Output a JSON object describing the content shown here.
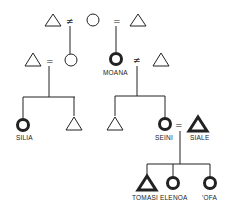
{
  "diagram": {
    "type": "kinship",
    "symbols": {
      "marriage": "=",
      "divorce": "≠"
    },
    "people": {
      "silia": {
        "label": "SILIA",
        "sex": "female",
        "ego_line": true
      },
      "moana": {
        "label": "MOANA",
        "sex": "female",
        "ego_line": true
      },
      "seini": {
        "label": "SEINI",
        "sex": "female",
        "ego_line": true
      },
      "siale": {
        "label": "SIALE",
        "sex": "male",
        "ego_line": true
      },
      "tomasi": {
        "label": "TOMASI",
        "sex": "male",
        "ego_line": true
      },
      "elenoa": {
        "label": "ELENOA",
        "sex": "female",
        "ego_line": true
      },
      "ofa": {
        "label": "'OFA",
        "sex": "female",
        "ego_line": true
      }
    },
    "colors": {
      "ink": "#222222",
      "background": "#ffffff"
    }
  }
}
